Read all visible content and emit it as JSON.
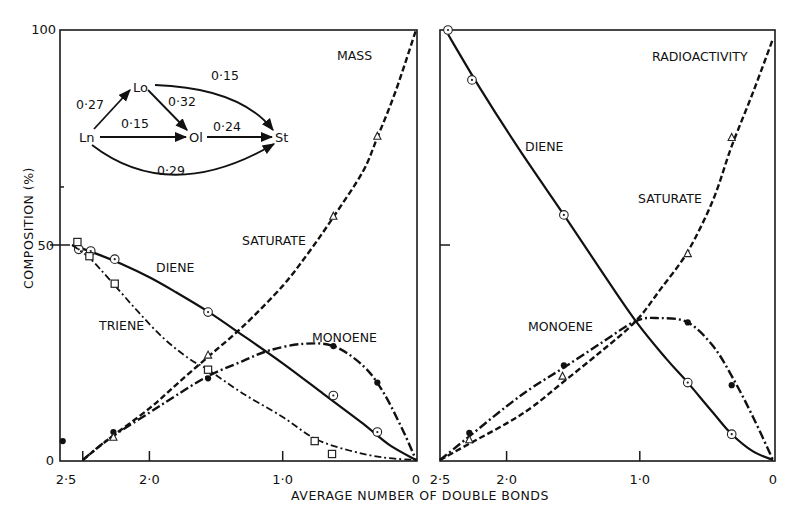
{
  "figure": {
    "y_axis_label": "COMPOSITION (%)",
    "x_axis_label": "AVERAGE NUMBER OF DOUBLE BONDS",
    "y_ticks": [
      "0",
      "50",
      "100"
    ]
  },
  "scheme": {
    "nodes": {
      "Ln": "Ln",
      "Lo": "Lo",
      "Ol": "Ol",
      "St": "St"
    },
    "rates": {
      "Ln_Lo": "0·27",
      "Lo_Ol": "0·32",
      "Lo_St": "0·15",
      "Ln_Ol": "0·15",
      "Ol_St": "0·24",
      "Ln_St": "0·29"
    }
  },
  "chart_data": [
    {
      "type": "line",
      "panel": "left",
      "title": "MASS",
      "xlabel": "AVERAGE NUMBER OF DOUBLE BONDS",
      "ylabel": "COMPOSITION (%)",
      "xlim": [
        2.67,
        0
      ],
      "ylim": [
        0,
        100
      ],
      "x_ticks": [
        2.5,
        2.0,
        1.0,
        0
      ],
      "x_tick_labels": [
        "2·5",
        "2·0",
        "1·0",
        "0"
      ],
      "y_ticks": [
        0,
        50,
        100
      ],
      "grid": false,
      "legend": "inline curve labels",
      "series": [
        {
          "name": "DIENE",
          "line": "solid",
          "marker": "circle-dot",
          "points": [
            [
              2.53,
              49
            ],
            [
              2.44,
              48.6
            ],
            [
              2.26,
              46.7
            ],
            [
              1.56,
              34.4
            ],
            [
              0.62,
              15
            ],
            [
              0.29,
              6.5
            ]
          ],
          "curve": [
            [
              2.58,
              50
            ],
            [
              2.4,
              48
            ],
            [
              2.2,
              45.5
            ],
            [
              2.0,
              42.5
            ],
            [
              1.8,
              39
            ],
            [
              1.56,
              34.5
            ],
            [
              1.3,
              29
            ],
            [
              1.0,
              22.5
            ],
            [
              0.7,
              15.5
            ],
            [
              0.4,
              8.5
            ],
            [
              0.2,
              3.5
            ],
            [
              0,
              0
            ]
          ]
        },
        {
          "name": "TRIENE",
          "line": "dash-dot (fine)",
          "marker": "square",
          "points": [
            [
              2.54,
              50.7
            ],
            [
              2.45,
              47.4
            ],
            [
              2.26,
              41
            ],
            [
              1.56,
              21
            ],
            [
              0.76,
              4.4
            ],
            [
              0.63,
              1.4
            ]
          ],
          "curve": [
            [
              2.58,
              50
            ],
            [
              2.45,
              47
            ],
            [
              2.3,
              42
            ],
            [
              2.1,
              35
            ],
            [
              1.9,
              28.5
            ],
            [
              1.7,
              23.5
            ],
            [
              1.56,
              21
            ],
            [
              1.3,
              15.5
            ],
            [
              1.0,
              10
            ],
            [
              0.76,
              5
            ],
            [
              0.5,
              2.2
            ],
            [
              0.25,
              0.6
            ],
            [
              0,
              0
            ]
          ]
        },
        {
          "name": "MONOENE",
          "line": "dash-dot (heavy)",
          "marker": "filled-dot",
          "points": [
            [
              2.65,
              4.4
            ],
            [
              2.27,
              6.5
            ],
            [
              1.56,
              19
            ],
            [
              0.62,
              26.5
            ],
            [
              0.29,
              18
            ]
          ],
          "curve": [
            [
              2.5,
              0
            ],
            [
              2.3,
              5
            ],
            [
              2.0,
              11
            ],
            [
              1.8,
              15
            ],
            [
              1.56,
              19.5
            ],
            [
              1.3,
              23
            ],
            [
              1.1,
              25.5
            ],
            [
              0.85,
              27
            ],
            [
              0.62,
              26.5
            ],
            [
              0.4,
              22
            ],
            [
              0.25,
              16
            ],
            [
              0.1,
              7
            ],
            [
              0,
              0
            ]
          ]
        },
        {
          "name": "SATURATE",
          "line": "dashed",
          "marker": "triangle",
          "points": [
            [
              2.27,
              5.3
            ],
            [
              1.56,
              24.4
            ],
            [
              0.62,
              56.7
            ],
            [
              0.29,
              75.3
            ]
          ],
          "curve": [
            [
              2.5,
              0
            ],
            [
              2.3,
              5
            ],
            [
              2.0,
              12
            ],
            [
              1.8,
              17.5
            ],
            [
              1.56,
              24
            ],
            [
              1.3,
              31
            ],
            [
              1.0,
              40.5
            ],
            [
              0.8,
              48.5
            ],
            [
              0.62,
              56.5
            ],
            [
              0.4,
              67
            ],
            [
              0.29,
              75
            ],
            [
              0.15,
              86
            ],
            [
              0,
              100
            ]
          ]
        }
      ]
    },
    {
      "type": "line",
      "panel": "right",
      "title": "RADIOACTIVITY",
      "xlabel": "AVERAGE NUMBER OF DOUBLE BONDS",
      "ylabel": "COMPOSITION (%)",
      "xlim": [
        2.5,
        0
      ],
      "ylim": [
        0,
        100
      ],
      "x_ticks": [
        2.5,
        2.0,
        1.0,
        0
      ],
      "x_tick_labels": [
        "2·5",
        "2·0",
        "1·0",
        "0"
      ],
      "y_ticks": [
        0,
        50,
        100
      ],
      "grid": false,
      "legend": "inline curve labels",
      "series": [
        {
          "name": "DIENE",
          "line": "solid",
          "marker": "circle-dot",
          "points": [
            [
              2.44,
              100
            ],
            [
              2.26,
              88.4
            ],
            [
              1.57,
              57
            ],
            [
              0.64,
              18
            ],
            [
              0.31,
              6
            ]
          ],
          "curve": [
            [
              2.44,
              99
            ],
            [
              2.2,
              86.5
            ],
            [
              1.9,
              72
            ],
            [
              1.57,
              57
            ],
            [
              1.3,
              44.5
            ],
            [
              1.03,
              32.3
            ],
            [
              0.8,
              23.5
            ],
            [
              0.64,
              18
            ],
            [
              0.45,
              11
            ],
            [
              0.31,
              6
            ],
            [
              0.15,
              2
            ],
            [
              0,
              0
            ]
          ]
        },
        {
          "name": "MONOENE",
          "line": "dash-dot (heavy)",
          "marker": "filled-dot",
          "points": [
            [
              2.28,
              6.3
            ],
            [
              1.57,
              22
            ],
            [
              0.64,
              32
            ],
            [
              0.31,
              17.4
            ]
          ],
          "curve": [
            [
              2.5,
              0
            ],
            [
              2.28,
              5.5
            ],
            [
              2.0,
              12.5
            ],
            [
              1.8,
              17
            ],
            [
              1.57,
              21.5
            ],
            [
              1.3,
              27
            ],
            [
              1.03,
              32.3
            ],
            [
              0.85,
              33
            ],
            [
              0.64,
              32
            ],
            [
              0.45,
              26.5
            ],
            [
              0.3,
              19
            ],
            [
              0.15,
              10
            ],
            [
              0,
              0
            ]
          ]
        },
        {
          "name": "SATURATE",
          "line": "dashed",
          "marker": "triangle",
          "points": [
            [
              2.28,
              4.7
            ],
            [
              1.58,
              19.5
            ],
            [
              0.64,
              48
            ],
            [
              0.31,
              75
            ]
          ],
          "curve": [
            [
              2.5,
              0
            ],
            [
              2.28,
              3.8
            ],
            [
              2.0,
              8.5
            ],
            [
              1.8,
              12.5
            ],
            [
              1.58,
              18
            ],
            [
              1.3,
              25
            ],
            [
              1.03,
              32.3
            ],
            [
              0.85,
              39.5
            ],
            [
              0.64,
              48.5
            ],
            [
              0.45,
              60.5
            ],
            [
              0.31,
              73
            ],
            [
              0.15,
              85.5
            ],
            [
              0,
              98
            ]
          ]
        }
      ]
    }
  ]
}
